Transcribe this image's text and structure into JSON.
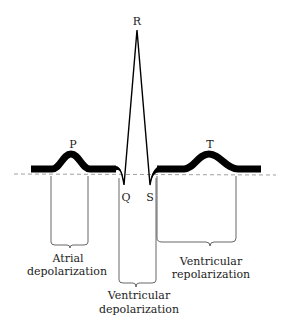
{
  "diagram": {
    "colors": {
      "trace": "#000000",
      "text": "#222222",
      "baseline": "#888888",
      "bracket": "#555555"
    },
    "wave_labels": {
      "p": "P",
      "q": "Q",
      "r": "R",
      "s": "S",
      "t": "T"
    },
    "intervals": [
      {
        "id": "atrial-depolarization",
        "line1": "Atrial",
        "line2": "depolarization"
      },
      {
        "id": "ventricular-depolarization",
        "line1": "Ventricular",
        "line2": "depolarization"
      },
      {
        "id": "ventricular-repolarization",
        "line1": "Ventricular",
        "line2": "repolarization"
      }
    ]
  }
}
